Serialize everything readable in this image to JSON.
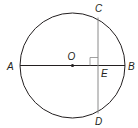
{
  "diagram": {
    "colors": {
      "stroke": "#231f20",
      "chord": "#8a8a8a",
      "background": "#ffffff"
    },
    "circle": {
      "center_label": "O",
      "cx": 72.5,
      "cy": 65.5,
      "r": 52.5
    },
    "points": [
      {
        "label": "A",
        "x": 20,
        "y": 65.5,
        "label_x": 7,
        "label_y": 69.5
      },
      {
        "label": "B",
        "x": 125,
        "y": 65.5,
        "label_x": 128,
        "label_y": 69.5
      },
      {
        "label": "O",
        "x": 72.5,
        "y": 65.5,
        "label_x": 67.5,
        "label_y": 60
      },
      {
        "label": "C",
        "x": 98,
        "y": 17.5,
        "label_x": 95,
        "label_y": 12
      },
      {
        "label": "D",
        "x": 98,
        "y": 113.5,
        "label_x": 95,
        "label_y": 125
      },
      {
        "label": "E",
        "x": 98,
        "y": 65.5,
        "label_x": 101,
        "label_y": 77
      }
    ],
    "segments": [
      {
        "name": "diameter-AB",
        "from": "A",
        "to": "B"
      },
      {
        "name": "chord-CD",
        "from": "C",
        "to": "D"
      }
    ],
    "right_angle": {
      "at": "E",
      "size": 8
    }
  }
}
